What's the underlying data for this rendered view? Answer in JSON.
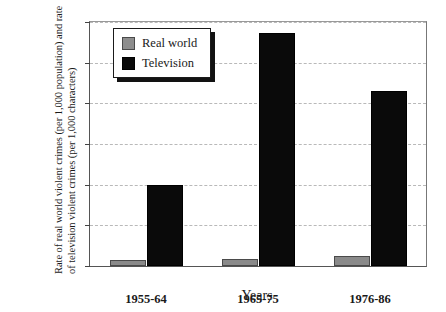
{
  "chart_data": {
    "type": "bar",
    "title": "",
    "subtitle": "",
    "xlabel": "Years",
    "ylabel": "Rate of real world violent crimes (per 1,000 population) and rate of television violent crimes (per 1,000 characters)",
    "categories": [
      "1955-64",
      "1965-75",
      "1976-86"
    ],
    "series": [
      {
        "name": "Real world",
        "color": "#8a8a8a",
        "values": [
          3,
          3.5,
          5
        ]
      },
      {
        "name": "Television",
        "color": "#0a0a0a",
        "values": [
          40,
          114.5,
          86
        ]
      }
    ],
    "ylim": [
      0,
      120
    ],
    "ytick_values": [
      0,
      20,
      40,
      60,
      80,
      100,
      120
    ],
    "ytick_labels": [
      "0",
      "20",
      "40",
      "60",
      "80",
      "100",
      "120"
    ],
    "grid": true,
    "grid_style": "dashed",
    "grid_color": "#b9b9b9",
    "legend_position": "upper left",
    "legend_entries": [
      "Real world",
      "Television"
    ]
  },
  "legend": {
    "items": [
      {
        "label": "Real world",
        "swatch": "gray-square-icon"
      },
      {
        "label": "Television",
        "swatch": "black-square-icon"
      }
    ]
  }
}
